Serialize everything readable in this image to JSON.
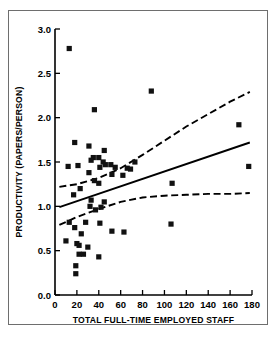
{
  "figure": {
    "name": "productivity-vs-staff-scatterplot",
    "background_color": "#ffffff",
    "frame_color": "#6e6e6e",
    "marker_color": "#111111",
    "line_color": "#000000"
  },
  "chart_data": {
    "type": "scatter",
    "title": "",
    "xlabel": "TOTAL FULL-TIME EMPLOYED STAFF",
    "ylabel": "PRODUCTIVITY (PAPERS/PERSON)",
    "xlim": [
      0,
      180
    ],
    "ylim": [
      0.0,
      3.0
    ],
    "xticks": [
      0,
      20,
      40,
      60,
      80,
      100,
      120,
      140,
      160,
      180
    ],
    "yticks": [
      0.0,
      0.5,
      1.0,
      1.5,
      2.0,
      2.5,
      3.0
    ],
    "xtick_labels": [
      "0",
      "20",
      "40",
      "60",
      "80",
      "100",
      "120",
      "140",
      "160",
      "180"
    ],
    "ytick_labels": [
      "0.0",
      "0.5",
      "1.0",
      "1.5",
      "2.0",
      "2.5",
      "3.0"
    ],
    "grid": false,
    "legend": false,
    "marker": "square",
    "points": [
      {
        "x": 13,
        "y": 2.78
      },
      {
        "x": 36,
        "y": 2.09
      },
      {
        "x": 88,
        "y": 2.3
      },
      {
        "x": 168,
        "y": 1.92
      },
      {
        "x": 18,
        "y": 1.72
      },
      {
        "x": 31,
        "y": 1.68
      },
      {
        "x": 45,
        "y": 1.63
      },
      {
        "x": 35,
        "y": 1.55
      },
      {
        "x": 40,
        "y": 1.55
      },
      {
        "x": 33,
        "y": 1.52
      },
      {
        "x": 44,
        "y": 1.5
      },
      {
        "x": 73,
        "y": 1.5
      },
      {
        "x": 21,
        "y": 1.46
      },
      {
        "x": 12,
        "y": 1.45
      },
      {
        "x": 41,
        "y": 1.44
      },
      {
        "x": 46,
        "y": 1.47
      },
      {
        "x": 51,
        "y": 1.47
      },
      {
        "x": 55,
        "y": 1.44
      },
      {
        "x": 66,
        "y": 1.43
      },
      {
        "x": 69,
        "y": 1.42
      },
      {
        "x": 177,
        "y": 1.45
      },
      {
        "x": 31,
        "y": 1.38
      },
      {
        "x": 52,
        "y": 1.36
      },
      {
        "x": 62,
        "y": 1.35
      },
      {
        "x": 36,
        "y": 1.29
      },
      {
        "x": 40,
        "y": 1.26
      },
      {
        "x": 107,
        "y": 1.26
      },
      {
        "x": 23,
        "y": 1.2
      },
      {
        "x": 17,
        "y": 1.13
      },
      {
        "x": 33,
        "y": 1.07
      },
      {
        "x": 45,
        "y": 1.05
      },
      {
        "x": 32,
        "y": 1.0
      },
      {
        "x": 42,
        "y": 0.99
      },
      {
        "x": 37,
        "y": 0.96
      },
      {
        "x": 13,
        "y": 0.82
      },
      {
        "x": 28,
        "y": 0.82
      },
      {
        "x": 41,
        "y": 0.81
      },
      {
        "x": 106,
        "y": 0.8
      },
      {
        "x": 18,
        "y": 0.76
      },
      {
        "x": 52,
        "y": 0.72
      },
      {
        "x": 63,
        "y": 0.71
      },
      {
        "x": 24,
        "y": 0.69
      },
      {
        "x": 10,
        "y": 0.61
      },
      {
        "x": 20,
        "y": 0.58
      },
      {
        "x": 22,
        "y": 0.56
      },
      {
        "x": 30,
        "y": 0.54
      },
      {
        "x": 22,
        "y": 0.46
      },
      {
        "x": 26,
        "y": 0.46
      },
      {
        "x": 40,
        "y": 0.43
      },
      {
        "x": 19,
        "y": 0.33
      },
      {
        "x": 19,
        "y": 0.24
      }
    ],
    "fit_line": {
      "name": "regression-line",
      "style": "solid",
      "points": [
        [
          4,
          0.99
        ],
        [
          178,
          1.72
        ]
      ]
    },
    "confidence_bands": [
      {
        "name": "upper-confidence-band",
        "style": "dashed",
        "points": [
          [
            4,
            1.22
          ],
          [
            20,
            1.25
          ],
          [
            40,
            1.32
          ],
          [
            60,
            1.43
          ],
          [
            80,
            1.58
          ],
          [
            100,
            1.74
          ],
          [
            120,
            1.9
          ],
          [
            140,
            2.04
          ],
          [
            160,
            2.18
          ],
          [
            178,
            2.29
          ]
        ]
      },
      {
        "name": "lower-confidence-band",
        "style": "dashed",
        "points": [
          [
            4,
            0.79
          ],
          [
            20,
            0.88
          ],
          [
            40,
            0.97
          ],
          [
            60,
            1.05
          ],
          [
            80,
            1.1
          ],
          [
            100,
            1.12
          ],
          [
            120,
            1.13
          ],
          [
            140,
            1.14
          ],
          [
            160,
            1.14
          ],
          [
            178,
            1.15
          ]
        ]
      }
    ]
  }
}
